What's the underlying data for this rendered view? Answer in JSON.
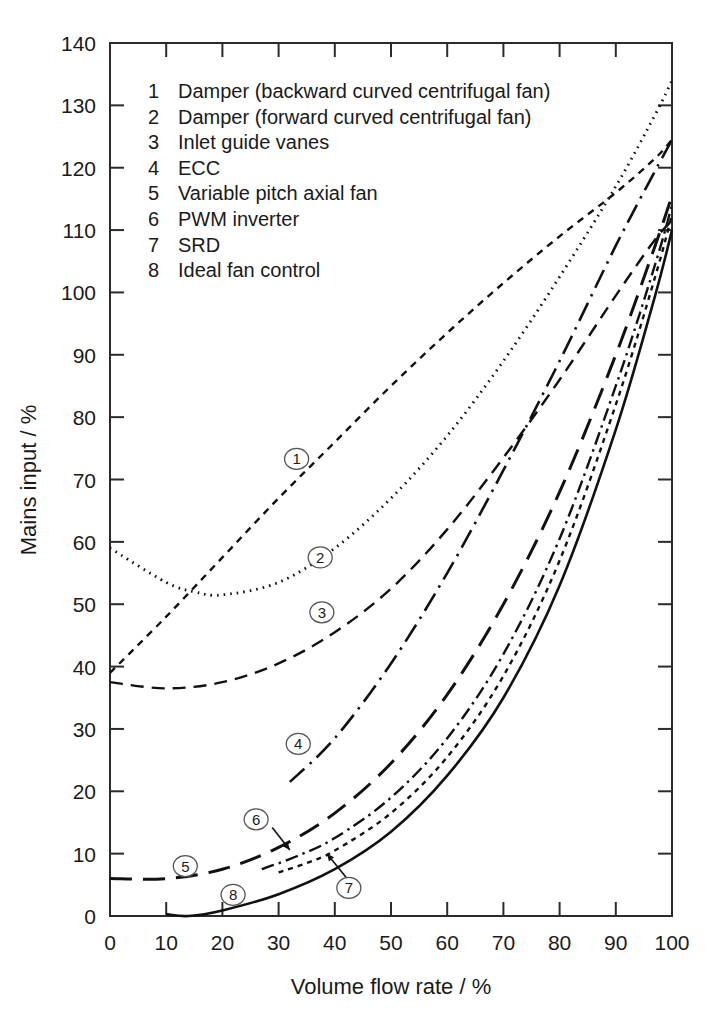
{
  "chart_data": {
    "type": "line",
    "title": "",
    "xlabel": "Volume flow rate / %",
    "ylabel": "Mains input / %",
    "xlim": [
      0,
      100
    ],
    "ylim": [
      0,
      140
    ],
    "xticks": [
      0,
      10,
      20,
      30,
      40,
      50,
      60,
      70,
      80,
      90,
      100
    ],
    "yticks": [
      0,
      10,
      20,
      30,
      40,
      50,
      60,
      70,
      80,
      90,
      100,
      110,
      120,
      130,
      140
    ],
    "xtick_labels": [
      "0",
      "10",
      "20",
      "30",
      "40",
      "50",
      "60",
      "70",
      "80",
      "90",
      "100"
    ],
    "ytick_labels": [
      "0",
      "10",
      "20",
      "30",
      "40",
      "50",
      "60",
      "70",
      "80",
      "90",
      "100",
      "110",
      "120",
      "130",
      "140"
    ],
    "grid": false,
    "legend_position": "upper-left-inside",
    "series": [
      {
        "key": "1",
        "name": "Damper (backward curved centrifugal fan)",
        "linestyle": "short-dash",
        "x": [
          0,
          10,
          20,
          30,
          40,
          50,
          60,
          70,
          80,
          90,
          97,
          100
        ],
        "values": [
          39,
          48,
          57.5,
          67,
          76,
          85,
          93.5,
          101.5,
          109,
          116,
          121.5,
          124.5
        ]
      },
      {
        "key": "2",
        "name": "Damper (forward curved centrifugal fan)",
        "linestyle": "dotted",
        "x": [
          0,
          10,
          15,
          20,
          30,
          40,
          50,
          60,
          70,
          80,
          90,
          97,
          100
        ],
        "values": [
          59,
          53.5,
          52,
          51.5,
          53.5,
          59,
          67,
          77,
          89,
          102.5,
          117,
          128.5,
          134
        ]
      },
      {
        "key": "3",
        "name": "Inlet guide vanes",
        "linestyle": "medium-dash",
        "x": [
          0,
          10,
          20,
          30,
          40,
          50,
          60,
          70,
          80,
          90,
          97,
          100
        ],
        "values": [
          37.5,
          36.5,
          37.5,
          40.5,
          45.5,
          52.5,
          62,
          73.5,
          86,
          99.5,
          108.5,
          111.5
        ]
      },
      {
        "key": "4",
        "name": "ECC",
        "linestyle": "dash-dot",
        "x": [
          32,
          40,
          50,
          60,
          70,
          80,
          90,
          97,
          100
        ],
        "values": [
          21.5,
          28.5,
          40.5,
          55,
          71.5,
          89,
          107.5,
          119.5,
          124.5
        ]
      },
      {
        "key": "5",
        "name": "Variable pitch axial fan",
        "linestyle": "long-dash",
        "x": [
          0,
          10,
          20,
          30,
          40,
          50,
          60,
          70,
          80,
          90,
          97,
          100
        ],
        "values": [
          6,
          6,
          7.5,
          11,
          16.5,
          24.5,
          35.5,
          50,
          68,
          90,
          107.5,
          115.5
        ]
      },
      {
        "key": "6",
        "name": "PWM inverter",
        "linestyle": "dash-dot-short",
        "x": [
          27,
          33,
          40,
          50,
          60,
          70,
          80,
          90,
          97,
          100
        ],
        "values": [
          7.5,
          9.5,
          12.5,
          19,
          28.5,
          42,
          60.5,
          85,
          104.5,
          114
        ]
      },
      {
        "key": "7",
        "name": "SRD",
        "linestyle": "fine-dash",
        "x": [
          30,
          35,
          40,
          50,
          60,
          70,
          80,
          90,
          97,
          100
        ],
        "values": [
          7,
          8.5,
          10.5,
          16.5,
          25.5,
          38.5,
          57,
          82,
          102.5,
          112.5
        ]
      },
      {
        "key": "8",
        "name": "Ideal fan control",
        "linestyle": "solid",
        "x": [
          10,
          14,
          20,
          30,
          40,
          50,
          60,
          70,
          80,
          90,
          97,
          100
        ],
        "values": [
          0.3,
          0,
          0.9,
          3.5,
          7.5,
          13.5,
          22.5,
          35,
          53,
          78,
          99.5,
          110
        ]
      }
    ],
    "annotations": [
      {
        "label": "1",
        "x": 33.2,
        "y": 73.3
      },
      {
        "label": "2",
        "x": 37.4,
        "y": 57.5
      },
      {
        "label": "3",
        "x": 37.7,
        "y": 48.7
      },
      {
        "label": "4",
        "x": 33.5,
        "y": 27.6
      },
      {
        "label": "5",
        "x": 13.4,
        "y": 8.0
      },
      {
        "label": "6",
        "x": 26.0,
        "y": 15.5
      },
      {
        "label": "7",
        "x": 42.5,
        "y": 4.5
      },
      {
        "label": "8",
        "x": 21.9,
        "y": 3.4
      }
    ]
  },
  "legend": {
    "items": [
      {
        "num": "1",
        "label": "Damper (backward curved centrifugal fan)"
      },
      {
        "num": "2",
        "label": "Damper (forward curved centrifugal fan)"
      },
      {
        "num": "3",
        "label": "Inlet guide vanes"
      },
      {
        "num": "4",
        "label": "ECC"
      },
      {
        "num": "5",
        "label": "Variable pitch axial fan"
      },
      {
        "num": "6",
        "label": "PWM inverter"
      },
      {
        "num": "7",
        "label": "SRD"
      },
      {
        "num": "8",
        "label": "Ideal fan control"
      }
    ]
  },
  "colors": {
    "ink": "#111111",
    "frame": "#2b2b2b",
    "background": "#ffffff"
  }
}
